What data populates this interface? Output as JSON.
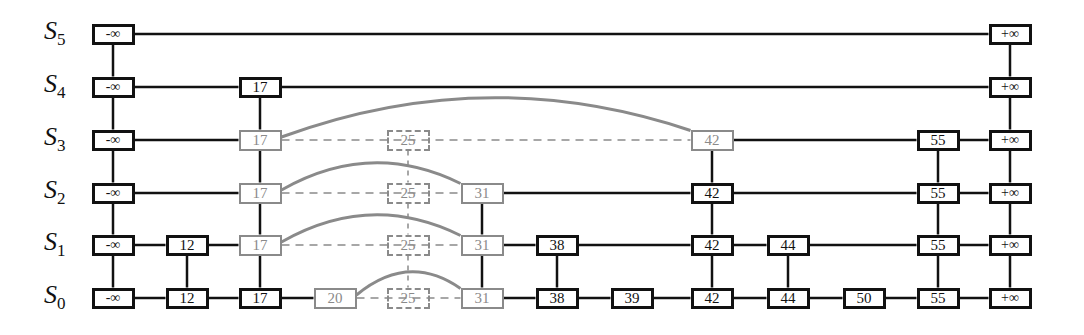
{
  "diagram": {
    "type": "skip-list",
    "levels": [
      {
        "id": "S5",
        "label": "S",
        "sub": "5",
        "y": 34
      },
      {
        "id": "S4",
        "label": "S",
        "sub": "4",
        "y": 87
      },
      {
        "id": "S3",
        "label": "S",
        "sub": "3",
        "y": 140
      },
      {
        "id": "S2",
        "label": "S",
        "sub": "2",
        "y": 193
      },
      {
        "id": "S1",
        "label": "S",
        "sub": "1",
        "y": 245
      },
      {
        "id": "S0",
        "label": "S",
        "sub": "0",
        "y": 298
      }
    ],
    "columns": [
      {
        "key": "-∞",
        "x": 113,
        "top": "S5",
        "style": "black"
      },
      {
        "key": "12",
        "x": 187,
        "top": "S1",
        "style": "black"
      },
      {
        "key": "17",
        "x": 260,
        "top": "S4",
        "style": "mixed",
        "gray_levels": [
          "S3",
          "S2",
          "S1"
        ]
      },
      {
        "key": "20",
        "x": 335,
        "top": "S0",
        "style": "gray"
      },
      {
        "key": "25",
        "x": 408,
        "top": "S3",
        "style": "ghost"
      },
      {
        "key": "31",
        "x": 482,
        "top": "S2",
        "style": "gray"
      },
      {
        "key": "38",
        "x": 557,
        "top": "S1",
        "style": "black"
      },
      {
        "key": "39",
        "x": 632,
        "top": "S0",
        "style": "black"
      },
      {
        "key": "42",
        "x": 712,
        "top": "S3",
        "style": "mixed",
        "gray_levels": [
          "S3"
        ]
      },
      {
        "key": "44",
        "x": 788,
        "top": "S1",
        "style": "black"
      },
      {
        "key": "50",
        "x": 864,
        "top": "S0",
        "style": "black"
      },
      {
        "key": "55",
        "x": 938,
        "top": "S3",
        "style": "black"
      },
      {
        "key": "+∞",
        "x": 1010,
        "top": "S5",
        "style": "black"
      }
    ],
    "rows": {
      "S5": [
        "-∞",
        "+∞"
      ],
      "S4": [
        "-∞",
        "17",
        "+∞"
      ],
      "S3": [
        "-∞",
        "17",
        "25",
        "42",
        "55",
        "+∞"
      ],
      "S2": [
        "-∞",
        "17",
        "25",
        "31",
        "42",
        "55",
        "+∞"
      ],
      "S1": [
        "-∞",
        "12",
        "17",
        "25",
        "31",
        "38",
        "42",
        "44",
        "55",
        "+∞"
      ],
      "S0": [
        "-∞",
        "12",
        "17",
        "20",
        "25",
        "31",
        "38",
        "39",
        "42",
        "44",
        "50",
        "55",
        "+∞"
      ]
    },
    "new_links": [
      {
        "level": "S3",
        "from": "17",
        "to": "42"
      },
      {
        "level": "S2",
        "from": "17",
        "to": "31"
      },
      {
        "level": "S1",
        "from": "17",
        "to": "31"
      },
      {
        "level": "S0",
        "from": "20",
        "to": "31"
      }
    ],
    "removed_key": "25",
    "colors": {
      "line": "#111111",
      "highlight": "#8a8a8a",
      "background": "#ffffff"
    }
  }
}
